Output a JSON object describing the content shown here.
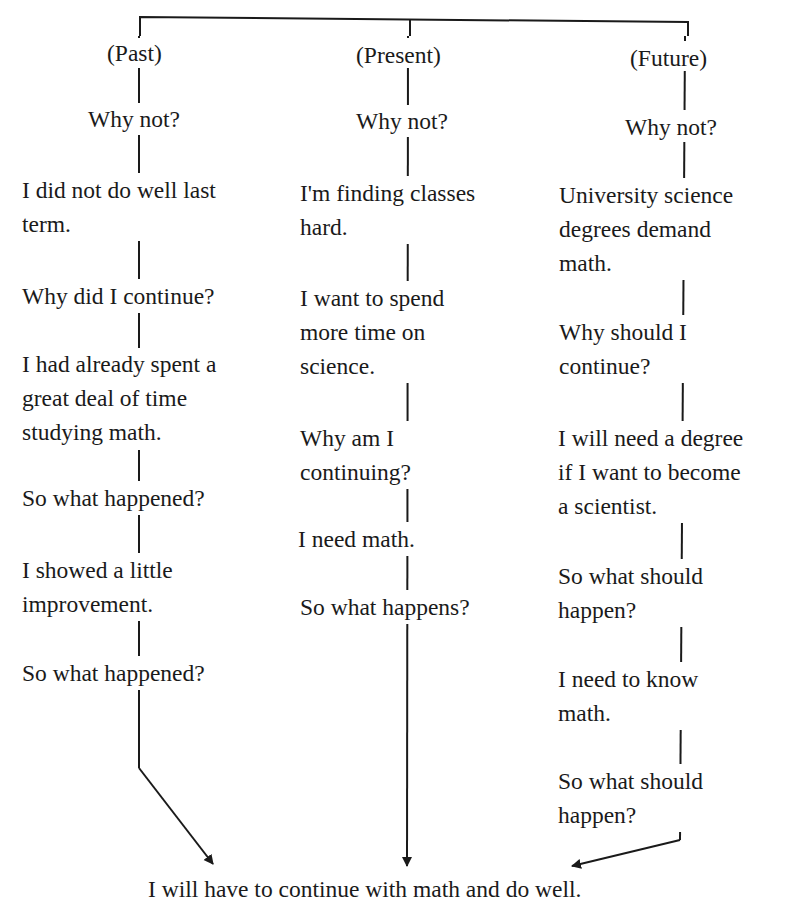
{
  "diagram": {
    "columns": [
      {
        "id": "past",
        "header": "(Past)",
        "nodes": [
          "Why not?",
          "I did not do well last\nterm.",
          "Why did I continue?",
          "I had already spent a\ngreat deal of time\nstudying math.",
          "So what happened?",
          "I showed a little\nimprovement.",
          "So what happened?"
        ]
      },
      {
        "id": "present",
        "header": "(Present)",
        "nodes": [
          "Why not?",
          "I'm finding classes\nhard.",
          "I want to spend\nmore time on\nscience.",
          "Why am I\ncontinuing?",
          "I need math.",
          "So what happens?"
        ]
      },
      {
        "id": "future",
        "header": "(Future)",
        "nodes": [
          "Why not?",
          "University science\ndegrees demand\nmath.",
          "Why should I\ncontinue?",
          "I will need a degree\nif I want to become\na scientist.",
          "So what should\nhappen?",
          "I need to know\nmath.",
          "So what should\nhappen?"
        ]
      }
    ],
    "conclusion": "I will have to continue with math and do well.",
    "colors": {
      "line": "#1a1a1a",
      "text": "#1a1a1a",
      "background": "#ffffff"
    }
  }
}
